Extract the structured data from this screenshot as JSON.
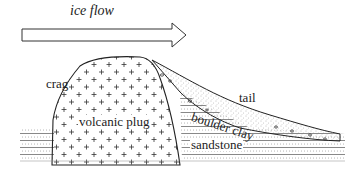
{
  "diagram": {
    "title_label": "ice flow",
    "labels": {
      "crag": "crag",
      "volcanic_plug": "volcanic plug",
      "tail": "tail",
      "boulder_clay": "boulder clay",
      "sandstone": "sandstone"
    },
    "colors": {
      "line": "#222222",
      "background": "#ffffff",
      "hatch": "#555555"
    }
  }
}
